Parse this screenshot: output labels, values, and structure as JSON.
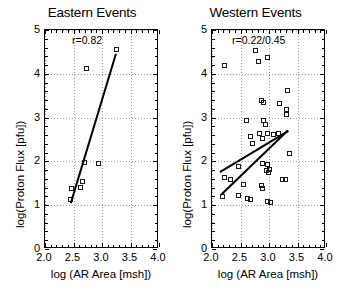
{
  "figure": {
    "background": "#ffffff",
    "marker_color": "#1a1a1a",
    "line_color": "#000000",
    "grid_color": "#9a9a9a"
  },
  "panels": [
    {
      "key": "eastern",
      "title": "Eastern Events",
      "annotation": "r=0.82",
      "xlabel": "log (AR Area [msh])",
      "ylabel": "log(Proton Flux [pfu])",
      "xticklabels": [
        "2.0",
        "2.5",
        "3.0",
        "3.5",
        "4.0"
      ],
      "yticklabels": [
        "0",
        "1",
        "2",
        "3",
        "4",
        "5"
      ]
    },
    {
      "key": "western",
      "title": "Western Events",
      "annotation": "r=0.22/0.45",
      "xlabel": "log (AR Area [msh])",
      "ylabel": "log(Proton Flux [pfu])",
      "xticklabels": [
        "2.0",
        "2.5",
        "3.0",
        "3.5",
        "4.0"
      ],
      "yticklabels": [
        "0",
        "1",
        "2",
        "3",
        "4",
        "5"
      ]
    }
  ],
  "chart_data": [
    {
      "type": "scatter",
      "title": "Eastern Events",
      "xlabel": "log (AR Area [msh])",
      "ylabel": "log(Proton Flux [pfu])",
      "xlim": [
        2.0,
        4.0
      ],
      "ylim": [
        0,
        5
      ],
      "xticks": [
        2.0,
        2.5,
        3.0,
        3.5,
        4.0
      ],
      "yticks": [
        0,
        1,
        2,
        3,
        4,
        5
      ],
      "grid": true,
      "legend": "none",
      "annotations": [
        {
          "text": "r=0.82",
          "x": 2.55,
          "y": 4.75
        }
      ],
      "correlation": 0.82,
      "points": [
        {
          "x": 2.46,
          "y": 1.13
        },
        {
          "x": 2.47,
          "y": 1.38
        },
        {
          "x": 2.63,
          "y": 1.4
        },
        {
          "x": 2.66,
          "y": 1.53
        },
        {
          "x": 2.7,
          "y": 1.97
        },
        {
          "x": 2.73,
          "y": 4.12
        },
        {
          "x": 2.95,
          "y": 1.93
        },
        {
          "x": 3.26,
          "y": 4.55
        }
      ],
      "fit_lines": [
        {
          "name": "eastern-fit",
          "x0": 2.45,
          "y0": 1.05,
          "x1": 3.24,
          "y1": 4.45
        }
      ]
    },
    {
      "type": "scatter",
      "title": "Western Events",
      "xlabel": "log (AR Area [msh])",
      "ylabel": "log(Proton Flux [pfu])",
      "xlim": [
        2.0,
        4.0
      ],
      "ylim": [
        0,
        5
      ],
      "xticks": [
        2.0,
        2.5,
        3.0,
        3.5,
        4.0
      ],
      "yticks": [
        0,
        1,
        2,
        3,
        4,
        5
      ],
      "grid": true,
      "legend": "none",
      "annotations": [
        {
          "text": "r=0.22/0.45",
          "x": 2.62,
          "y": 4.75
        }
      ],
      "correlation": [
        0.22,
        0.45
      ],
      "points": [
        {
          "x": 2.22,
          "y": 4.18
        },
        {
          "x": 2.78,
          "y": 4.52
        },
        {
          "x": 2.82,
          "y": 4.28
        },
        {
          "x": 2.98,
          "y": 4.37
        },
        {
          "x": 3.34,
          "y": 3.6
        },
        {
          "x": 2.88,
          "y": 3.38
        },
        {
          "x": 2.92,
          "y": 3.33
        },
        {
          "x": 3.2,
          "y": 3.3
        },
        {
          "x": 3.32,
          "y": 3.18
        },
        {
          "x": 3.32,
          "y": 3.07
        },
        {
          "x": 2.62,
          "y": 2.92
        },
        {
          "x": 2.92,
          "y": 2.93
        },
        {
          "x": 2.95,
          "y": 2.84
        },
        {
          "x": 2.84,
          "y": 2.62
        },
        {
          "x": 2.98,
          "y": 2.62
        },
        {
          "x": 3.08,
          "y": 2.6
        },
        {
          "x": 3.18,
          "y": 2.62
        },
        {
          "x": 2.68,
          "y": 2.55
        },
        {
          "x": 2.72,
          "y": 2.4
        },
        {
          "x": 2.9,
          "y": 2.52
        },
        {
          "x": 3.36,
          "y": 2.16
        },
        {
          "x": 2.47,
          "y": 1.88
        },
        {
          "x": 2.9,
          "y": 1.95
        },
        {
          "x": 2.98,
          "y": 1.92
        },
        {
          "x": 3.02,
          "y": 1.8
        },
        {
          "x": 2.22,
          "y": 1.62
        },
        {
          "x": 2.34,
          "y": 1.58
        },
        {
          "x": 2.96,
          "y": 1.78
        },
        {
          "x": 3.0,
          "y": 1.74
        },
        {
          "x": 3.24,
          "y": 1.58
        },
        {
          "x": 3.3,
          "y": 1.57
        },
        {
          "x": 2.57,
          "y": 1.45
        },
        {
          "x": 2.88,
          "y": 1.44
        },
        {
          "x": 2.9,
          "y": 1.36
        },
        {
          "x": 2.48,
          "y": 1.22
        },
        {
          "x": 2.2,
          "y": 1.18
        },
        {
          "x": 2.64,
          "y": 1.14
        },
        {
          "x": 2.68,
          "y": 1.13
        },
        {
          "x": 2.98,
          "y": 1.08
        },
        {
          "x": 3.04,
          "y": 1.06
        }
      ],
      "fit_lines": [
        {
          "name": "western-fit-upper",
          "x0": 2.14,
          "y0": 1.76,
          "x1": 3.34,
          "y1": 2.7
        },
        {
          "name": "western-fit-lower",
          "x0": 2.16,
          "y0": 1.22,
          "x1": 3.34,
          "y1": 2.7
        }
      ]
    }
  ]
}
